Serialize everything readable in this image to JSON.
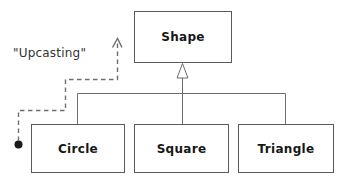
{
  "diagram": {
    "type": "uml-class-inheritance",
    "title_text": "",
    "background_color": "#ffffff",
    "line_color": "#6e6e6e",
    "box_border_color": "#5a5a5a",
    "text_color": "#171717",
    "annotation_color": "#333333",
    "nodes": [
      {
        "id": "shape",
        "label": "Shape",
        "role": "base-class",
        "x": 134,
        "y": 11,
        "width": 98,
        "height": 52
      },
      {
        "id": "circle",
        "label": "Circle",
        "role": "derived-class",
        "x": 31,
        "y": 124,
        "width": 94,
        "height": 49
      },
      {
        "id": "square",
        "label": "Square",
        "role": "derived-class",
        "x": 134,
        "y": 124,
        "width": 95,
        "height": 49
      },
      {
        "id": "triangle",
        "label": "Triangle",
        "role": "derived-class",
        "x": 238,
        "y": 124,
        "width": 96,
        "height": 49
      }
    ],
    "edges": [
      {
        "id": "circle-to-shape",
        "from": "circle",
        "to": "shape",
        "style": "solid",
        "arrow": "hollow-triangle"
      },
      {
        "id": "square-to-shape",
        "from": "square",
        "to": "shape",
        "style": "solid",
        "arrow": "hollow-triangle"
      },
      {
        "id": "triangle-to-shape",
        "from": "triangle",
        "to": "shape",
        "style": "solid",
        "arrow": "hollow-triangle"
      },
      {
        "id": "upcasting-edge",
        "from": "circle",
        "to": "shape",
        "style": "dashed",
        "arrow": "open-v",
        "source_marker": "filled-dot"
      }
    ],
    "annotation": {
      "id": "upcasting",
      "text": "\"Upcasting\"",
      "x": 13,
      "y": 46
    }
  }
}
